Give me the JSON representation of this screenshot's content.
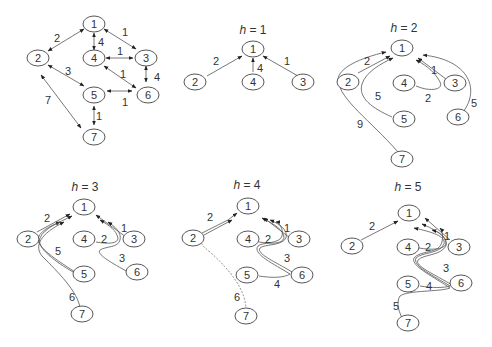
{
  "figure": {
    "panels": [
      {
        "id": "graph",
        "title": "",
        "nodes": [
          "1",
          "2",
          "3",
          "4",
          "5",
          "6",
          "7"
        ],
        "edges": [
          {
            "from": "1",
            "to": "2",
            "weight": "2",
            "type": "bidirectional"
          },
          {
            "from": "1",
            "to": "4",
            "weight": "4",
            "type": "bidirectional"
          },
          {
            "from": "1",
            "to": "3",
            "weight": "1",
            "type": "bidirectional"
          },
          {
            "from": "4",
            "to": "3",
            "weight": "1",
            "type": "bidirectional"
          },
          {
            "from": "2",
            "to": "5",
            "weight": "3",
            "type": "bidirectional"
          },
          {
            "from": "4",
            "to": "6",
            "weight": "1",
            "type": "bidirectional"
          },
          {
            "from": "3",
            "to": "6",
            "weight": "4",
            "type": "bidirectional"
          },
          {
            "from": "2",
            "to": "7",
            "weight": "7",
            "type": "bidirectional"
          },
          {
            "from": "5",
            "to": "6",
            "weight": "1",
            "type": "bidirectional"
          },
          {
            "from": "5",
            "to": "7",
            "weight": "1",
            "type": "bidirectional"
          }
        ]
      },
      {
        "id": "h1",
        "title_var": "h",
        "title_eq": " = 1",
        "nodes": [
          "1",
          "2",
          "4",
          "3"
        ],
        "paths": [
          {
            "from": "2",
            "cost": "2"
          },
          {
            "from": "4",
            "cost": "4"
          },
          {
            "from": "3",
            "cost": "1"
          }
        ]
      },
      {
        "id": "h2",
        "title_var": "h",
        "title_eq": " = 2",
        "nodes": [
          "1",
          "2",
          "4",
          "3",
          "5",
          "6",
          "7"
        ],
        "paths": [
          {
            "from": "2",
            "cost": "2"
          },
          {
            "from": "3",
            "cost": "1"
          },
          {
            "from": "4",
            "cost": "2"
          },
          {
            "from": "5",
            "cost": "5"
          },
          {
            "from": "6",
            "cost": "5"
          },
          {
            "from": "7",
            "cost": "9"
          }
        ]
      },
      {
        "id": "h3",
        "title_var": "h",
        "title_eq": " = 3",
        "nodes": [
          "1",
          "2",
          "4",
          "3",
          "5",
          "6",
          "7"
        ],
        "paths": [
          {
            "from": "2",
            "cost": "2"
          },
          {
            "from": "3",
            "cost": "1"
          },
          {
            "from": "4",
            "cost": "2"
          },
          {
            "from": "5",
            "cost": "5"
          },
          {
            "from": "6",
            "cost": "3"
          },
          {
            "from": "7",
            "cost": "6"
          }
        ]
      },
      {
        "id": "h4",
        "title_var": "h",
        "title_eq": " = 4",
        "nodes": [
          "1",
          "2",
          "4",
          "3",
          "5",
          "6",
          "7"
        ],
        "paths": [
          {
            "from": "2",
            "cost": "2"
          },
          {
            "from": "3",
            "cost": "1"
          },
          {
            "from": "4",
            "cost": "2"
          },
          {
            "from": "6",
            "cost": "3"
          },
          {
            "from": "5",
            "cost": "4"
          },
          {
            "from": "7",
            "cost": "6"
          }
        ]
      },
      {
        "id": "h5",
        "title_var": "h",
        "title_eq": " = 5",
        "nodes": [
          "1",
          "2",
          "4",
          "3",
          "5",
          "6",
          "7"
        ],
        "paths": [
          {
            "from": "2",
            "cost": "2"
          },
          {
            "from": "3",
            "cost": "1"
          },
          {
            "from": "4",
            "cost": "2"
          },
          {
            "from": "6",
            "cost": "3"
          },
          {
            "from": "5",
            "cost": "4"
          },
          {
            "from": "7",
            "cost": "5"
          }
        ]
      }
    ]
  }
}
